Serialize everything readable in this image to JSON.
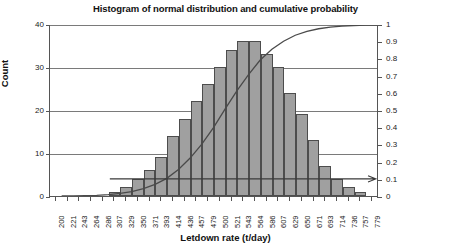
{
  "chart_data": {
    "type": "bar",
    "title": "Histogram of normal distribution and cumulative probability",
    "xlabel": "Letdown rate (t/day)",
    "ylabel": "Count",
    "ylabel_right": "Cumulative probability",
    "ylim": [
      0,
      40
    ],
    "ylim_right": [
      0,
      1
    ],
    "yticks": [
      0,
      10,
      20,
      30,
      40
    ],
    "yticks_right": [
      "0",
      "0.1",
      "0.2",
      "0.3",
      "0.4",
      "0.5",
      "0.6",
      "0.7",
      "0.8",
      "0.9",
      "1"
    ],
    "grid": true,
    "legend_position": "none",
    "categories": [
      "200",
      "221",
      "243",
      "264",
      "286",
      "307",
      "329",
      "350",
      "371",
      "393",
      "414",
      "436",
      "457",
      "479",
      "500",
      "521",
      "543",
      "564",
      "586",
      "607",
      "629",
      "650",
      "671",
      "693",
      "714",
      "736",
      "757",
      "779"
    ],
    "values": [
      0,
      0,
      0,
      0,
      0,
      1,
      2,
      4,
      6,
      9,
      14,
      18,
      22,
      26,
      30,
      34,
      36,
      36,
      33,
      30,
      24,
      19,
      13,
      7,
      4,
      2,
      1,
      0
    ],
    "series": [
      {
        "name": "Count",
        "type": "bar",
        "axis": "left",
        "values": [
          0,
          0,
          0,
          0,
          0,
          1,
          2,
          4,
          6,
          9,
          14,
          18,
          22,
          26,
          30,
          34,
          36,
          36,
          33,
          30,
          24,
          19,
          13,
          7,
          4,
          2,
          1,
          0
        ]
      },
      {
        "name": "Cumulative probability",
        "type": "line",
        "axis": "right",
        "values": [
          0.0,
          0.001,
          0.002,
          0.004,
          0.008,
          0.015,
          0.026,
          0.043,
          0.068,
          0.103,
          0.155,
          0.222,
          0.303,
          0.4,
          0.51,
          0.615,
          0.71,
          0.795,
          0.858,
          0.905,
          0.94,
          0.963,
          0.978,
          0.988,
          0.994,
          0.997,
          0.999,
          1.0
        ]
      }
    ],
    "annotations": [
      {
        "name": "reference-arrow",
        "type": "horizontal-arrow",
        "y_right": 0.1,
        "y_left_count": 4,
        "description": "horizontal arrow at cumulative probability 0.1 pointing right"
      }
    ],
    "colors": {
      "bar_fill": "#a0a0a0",
      "bar_border": "#4d4d4d",
      "curve": "#4a4a4a",
      "grid": "#7a7a7a",
      "axis": "#555555",
      "text": "#111111",
      "background": "#ffffff"
    }
  }
}
